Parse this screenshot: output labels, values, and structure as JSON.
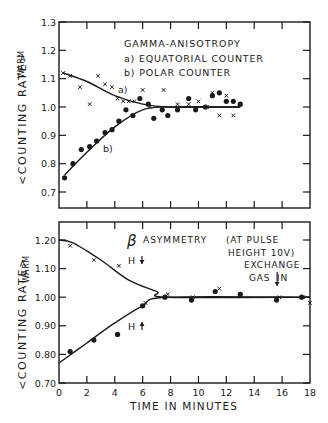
{
  "figure": {
    "xlabel": "TIME IN MINUTES",
    "ink_color": "#1a1a1a",
    "background": "#ffffff"
  },
  "chart_data": [
    {
      "type": "scatter",
      "title": "GAMMA-ANISOTROPY",
      "legend": [
        "a) EQUATORIAL COUNTER",
        "b) POLAR COUNTER"
      ],
      "xlabel": "TIME IN MINUTES",
      "ylabel": "<COUNTING RATE> WARM",
      "xlim": [
        0,
        18
      ],
      "ylim": [
        0.65,
        1.3
      ],
      "yticks": [
        "1.3",
        "1.2",
        "1.1",
        "1.0",
        "0.9",
        "0.8",
        "0.7"
      ],
      "curve_labels": [
        "a)",
        "b)"
      ],
      "series": [
        {
          "name": "a) Equatorial counter",
          "marker": "x",
          "x": [
            0.3,
            0.8,
            1.5,
            2.2,
            2.8,
            3.3,
            3.8,
            4.2,
            4.6,
            5.0,
            5.4,
            6.0,
            6.5,
            7.5,
            8.5,
            9.3,
            10.0,
            10.6,
            11.0,
            11.5,
            12.0,
            12.5,
            13.0
          ],
          "y": [
            1.12,
            1.11,
            1.07,
            1.01,
            1.11,
            1.08,
            1.07,
            1.03,
            1.02,
            1.02,
            1.02,
            1.06,
            1.0,
            1.06,
            1.01,
            1.01,
            1.02,
            1.0,
            1.05,
            0.97,
            1.04,
            0.97,
            1.01
          ]
        },
        {
          "name": "b) Polar counter",
          "marker": "dot",
          "x": [
            0.4,
            1.0,
            1.6,
            2.2,
            2.7,
            3.3,
            3.8,
            4.3,
            4.8,
            5.3,
            5.8,
            6.4,
            6.8,
            7.4,
            7.8,
            8.5,
            9.3,
            9.8,
            10.5,
            11.0,
            11.5,
            12.0,
            12.5,
            13.0
          ],
          "y": [
            0.75,
            0.8,
            0.85,
            0.86,
            0.88,
            0.91,
            0.92,
            0.95,
            0.99,
            0.97,
            1.03,
            1.01,
            0.96,
            0.99,
            0.97,
            0.99,
            1.03,
            0.99,
            1.0,
            1.04,
            1.05,
            1.02,
            1.02,
            1.01
          ]
        }
      ],
      "fit_curves": [
        {
          "name": "a) fit",
          "x": [
            0.3,
            2,
            4,
            6,
            8,
            13
          ],
          "y": [
            1.12,
            1.09,
            1.04,
            1.01,
            1.0,
            1.0
          ]
        },
        {
          "name": "b) fit",
          "x": [
            0.4,
            2,
            4,
            6,
            8,
            13
          ],
          "y": [
            0.76,
            0.84,
            0.93,
            0.99,
            1.0,
            1.0
          ]
        }
      ],
      "grid": false
    },
    {
      "type": "scatter",
      "title": "β ASYMMETRY",
      "annotation": "(AT PULSE HEIGHT 10V)",
      "arrow_annotation": {
        "label": "EXCHANGE GAS IN",
        "x": 15.5
      },
      "xlabel": "TIME IN MINUTES",
      "ylabel": "<COUNTING RATE> WARM",
      "xlim": [
        0,
        18
      ],
      "ylim": [
        0.7,
        1.26
      ],
      "xticks": [
        "0",
        "2",
        "4",
        "6",
        "8",
        "10",
        "12",
        "14",
        "16",
        "18"
      ],
      "yticks": [
        "1.20",
        "1.10",
        "1.00",
        "0.90",
        "0.80",
        "0.70"
      ],
      "curve_labels": [
        "H↓",
        "H↑"
      ],
      "series": [
        {
          "name": "H↓",
          "marker": "x",
          "x": [
            0.8,
            2.5,
            4.3,
            6.2,
            7.8,
            9.6,
            11.5,
            13.0,
            15.8,
            17.5,
            18.0
          ],
          "y": [
            1.18,
            1.13,
            1.11,
            0.98,
            1.01,
            1.0,
            1.03,
            1.01,
            1.0,
            1.0,
            0.98
          ]
        },
        {
          "name": "H↑",
          "marker": "dot",
          "x": [
            0.8,
            2.5,
            4.2,
            6.0,
            7.6,
            9.5,
            11.2,
            13.0,
            15.6,
            17.4
          ],
          "y": [
            0.81,
            0.85,
            0.87,
            0.97,
            1.0,
            0.99,
            1.02,
            1.01,
            0.99,
            1.0
          ]
        }
      ],
      "fit_curves": [
        {
          "name": "H↓ fit",
          "x": [
            0,
            1,
            3,
            5,
            7,
            7.8,
            18
          ],
          "y": [
            1.2,
            1.19,
            1.13,
            1.06,
            1.02,
            1.0,
            1.0
          ]
        },
        {
          "name": "H↑ fit",
          "x": [
            0,
            2,
            4,
            6,
            7.8,
            18
          ],
          "y": [
            0.77,
            0.84,
            0.91,
            0.97,
            1.0,
            1.0
          ]
        }
      ],
      "grid": false
    }
  ],
  "labels": {
    "top_title": "GAMMA-ANISOTROPY",
    "top_legend_a": "a) EQUATORIAL COUNTER",
    "top_legend_b": "b) POLAR COUNTER",
    "top_curve_a": "a)",
    "top_curve_b": "b)",
    "ylabel_main": "<COUNTING RATE>",
    "ylabel_sub": "WARM",
    "bottom_beta": "β",
    "bottom_title": "ASYMMETRY",
    "bottom_note_1": "(AT PULSE",
    "bottom_note_2": "HEIGHT 10V)",
    "exchange_1": "EXCHANGE",
    "exchange_2a": "GAS",
    "exchange_2b": "IN",
    "h_down": "H",
    "h_up": "H",
    "xlabel": "TIME IN MINUTES"
  }
}
